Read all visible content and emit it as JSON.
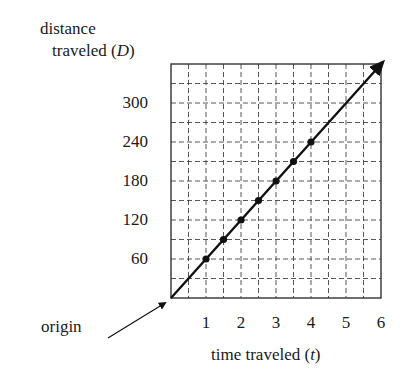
{
  "chart_data": {
    "type": "line",
    "title": "",
    "xlabel": "time traveled (t)",
    "ylabel": "distance traveled (D)",
    "xlabel_parts": {
      "text": "time traveled (",
      "var": "t",
      "close": ")"
    },
    "ylabel_parts": {
      "line1": "distance",
      "text": "traveled (",
      "var": "D",
      "close": ")"
    },
    "xlim": [
      0,
      6
    ],
    "ylim": [
      0,
      360
    ],
    "x_ticks": [
      1,
      2,
      3,
      4,
      5,
      6
    ],
    "y_ticks": [
      60,
      120,
      180,
      240,
      300
    ],
    "grid": true,
    "grid_cells": {
      "x": 12,
      "y": 12,
      "x_step": 0.5,
      "y_step": 30
    },
    "line": {
      "equation": "D = 60t",
      "x": [
        0,
        6
      ],
      "y": [
        0,
        360
      ],
      "arrow_end": true
    },
    "series": [
      {
        "name": "points",
        "x": [
          1,
          1.5,
          2,
          2.5,
          3,
          3.5,
          4
        ],
        "y": [
          60,
          90,
          120,
          150,
          180,
          210,
          240
        ]
      }
    ],
    "annotations": [
      {
        "text": "origin",
        "points_to": [
          0,
          0
        ]
      }
    ]
  }
}
